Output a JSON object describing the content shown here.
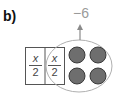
{
  "label": "b)",
  "operation": "−6",
  "cells": [
    {
      "numerator": "x",
      "denominator": "2"
    },
    {
      "numerator": "x",
      "denominator": "2"
    }
  ],
  "counters": {
    "count": 4,
    "color": "#6e6e6e"
  },
  "colors": {
    "outline": "#555555",
    "ellipse": "#b0b0b0",
    "arrow": "#8a8a8a",
    "text_gray": "#9a9a9a"
  }
}
